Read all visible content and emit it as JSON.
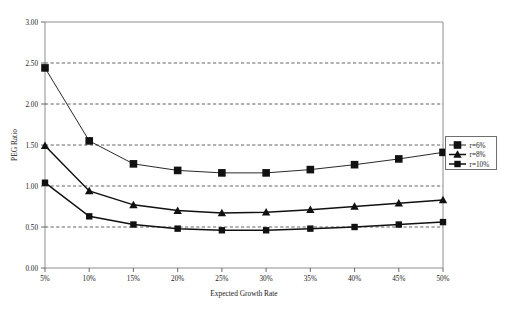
{
  "chart_data": {
    "type": "line",
    "title": "",
    "xlabel": "Expected Growth Rate",
    "ylabel": "PEG Ratio",
    "x": [
      "5%",
      "10%",
      "15%",
      "20%",
      "25%",
      "30%",
      "35%",
      "40%",
      "45%",
      "50%"
    ],
    "xlim": [
      0,
      9
    ],
    "ylim": [
      0.0,
      3.0
    ],
    "ytick_labels": [
      "0.00",
      "0.50",
      "1.00",
      "1.50",
      "2.00",
      "2.50",
      "3.00"
    ],
    "ytick_values": [
      0.0,
      0.5,
      1.0,
      1.5,
      2.0,
      2.5,
      3.0
    ],
    "grid": true,
    "grid_axis": "y",
    "legend_position": "right",
    "series": [
      {
        "name": "r=6%",
        "marker": "square",
        "values": [
          2.44,
          1.55,
          1.27,
          1.19,
          1.16,
          1.16,
          1.2,
          1.26,
          1.33,
          1.41
        ]
      },
      {
        "name": "r=8%",
        "marker": "triangle",
        "values": [
          1.49,
          0.94,
          0.77,
          0.7,
          0.67,
          0.68,
          0.71,
          0.75,
          0.79,
          0.83
        ]
      },
      {
        "name": "r=10%",
        "marker": "square-small",
        "values": [
          1.04,
          0.63,
          0.53,
          0.48,
          0.46,
          0.46,
          0.48,
          0.5,
          0.53,
          0.56
        ]
      }
    ]
  },
  "legend": {
    "entries": [
      "r=6%",
      "r=8%",
      "r=10%"
    ]
  },
  "caption": {
    "text": ""
  },
  "colors": {
    "series": "#111111",
    "frame": "#8e8e8e",
    "grid": "#3a3a3a",
    "text": "#1a1a1a"
  }
}
